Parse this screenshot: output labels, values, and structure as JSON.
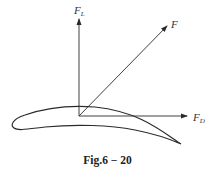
{
  "figure": {
    "caption": "Fig.6 − 20"
  },
  "labels": {
    "lift": {
      "main": "F",
      "sub": "L"
    },
    "resultant": {
      "main": "F"
    },
    "drag": {
      "main": "F",
      "sub": "D"
    }
  },
  "colors": {
    "stroke": "#2a2a2a",
    "background": "#ffffff"
  }
}
